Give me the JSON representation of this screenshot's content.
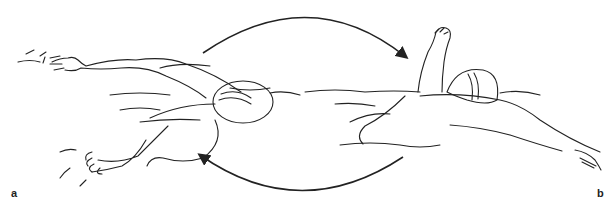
{
  "figure": {
    "panels": [
      {
        "label": "a",
        "description": "swimmer-front-crawl-arm-extended-forward"
      },
      {
        "label": "b",
        "description": "swimmer-arm-recovery-raised"
      }
    ],
    "arrows": [
      {
        "direction": "clockwise-top",
        "from": "a",
        "to": "b"
      },
      {
        "direction": "clockwise-bottom",
        "from": "b",
        "to": "a"
      }
    ],
    "colors": {
      "ink": "#222222",
      "background": "#ffffff"
    }
  }
}
